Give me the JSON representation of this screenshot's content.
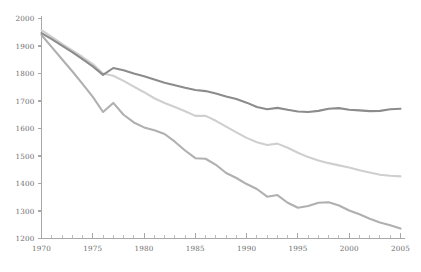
{
  "chart_data": {
    "type": "line",
    "title": "",
    "subtitle": "",
    "xlabel": "",
    "ylabel": "",
    "xlim": [
      1970,
      2005
    ],
    "ylim": [
      1200,
      2000
    ],
    "grid": false,
    "legend_position": "none",
    "x_tick_labels": [
      "1970",
      "1975",
      "1980",
      "1985",
      "1990",
      "1995",
      "2000",
      "2005"
    ],
    "x_tick_values": [
      1970,
      1975,
      1980,
      1985,
      1990,
      1995,
      2000,
      2005
    ],
    "x_minor_tick_step": 1,
    "y_tick_labels": [
      "1200",
      "1300",
      "1400",
      "1500",
      "1600",
      "1700",
      "1800",
      "1900",
      "2000"
    ],
    "y_tick_values": [
      1200,
      1300,
      1400,
      1500,
      1600,
      1700,
      1800,
      1900,
      2000
    ],
    "x": [
      1970,
      1971,
      1972,
      1973,
      1974,
      1975,
      1976,
      1977,
      1978,
      1979,
      1980,
      1981,
      1982,
      1983,
      1984,
      1985,
      1986,
      1987,
      1988,
      1989,
      1990,
      1991,
      1992,
      1993,
      1994,
      1995,
      1996,
      1997,
      1998,
      1999,
      2000,
      2001,
      2002,
      2003,
      2004,
      2005
    ],
    "series": [
      {
        "name": "series-top",
        "color": "#8c8c8c",
        "line_width": 2.1,
        "values": [
          1947,
          1925,
          1901,
          1878,
          1852,
          1826,
          1795,
          1820,
          1812,
          1800,
          1790,
          1778,
          1766,
          1757,
          1748,
          1740,
          1736,
          1727,
          1716,
          1707,
          1694,
          1678,
          1670,
          1675,
          1668,
          1662,
          1660,
          1664,
          1672,
          1674,
          1668,
          1666,
          1663,
          1664,
          1670,
          1672
        ]
      },
      {
        "name": "series-middle",
        "color": "#cfcfcf",
        "line_width": 2.1,
        "values": [
          1958,
          1933,
          1908,
          1884,
          1860,
          1834,
          1800,
          1792,
          1773,
          1752,
          1732,
          1710,
          1693,
          1678,
          1663,
          1646,
          1646,
          1628,
          1607,
          1586,
          1566,
          1550,
          1540,
          1545,
          1530,
          1512,
          1496,
          1484,
          1474,
          1466,
          1458,
          1448,
          1440,
          1432,
          1428,
          1426
        ]
      },
      {
        "name": "series-bottom",
        "color": "#b0b0b0",
        "line_width": 2.1,
        "values": [
          1940,
          1896,
          1852,
          1808,
          1762,
          1715,
          1660,
          1693,
          1650,
          1622,
          1604,
          1594,
          1580,
          1552,
          1520,
          1492,
          1490,
          1468,
          1438,
          1420,
          1398,
          1380,
          1352,
          1358,
          1330,
          1312,
          1318,
          1330,
          1332,
          1320,
          1302,
          1288,
          1272,
          1258,
          1248,
          1236
        ]
      }
    ]
  },
  "caption": {
    "text": ""
  }
}
